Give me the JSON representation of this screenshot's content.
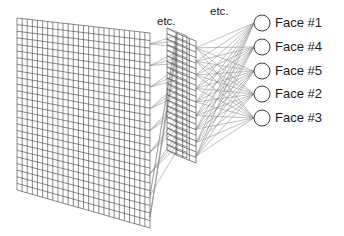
{
  "diagram": {
    "type": "neural-network",
    "background_color": "#ffffff",
    "line_color": "#8c8c8c",
    "grid_color": "#4a4a4a",
    "text_color": "#1a1a1a",
    "annotations": [
      {
        "id": "etc-hidden",
        "text": "etc.",
        "x": 157,
        "y": 22
      },
      {
        "id": "etc-output",
        "text": "etc.",
        "x": 210,
        "y": 12
      }
    ],
    "input_layer": {
      "name": "input-image-grid",
      "cols": 26,
      "rows": 26,
      "top_left": {
        "x": 17,
        "y": 18
      },
      "top_right": {
        "x": 150,
        "y": 33
      },
      "bottom_left": {
        "x": 17,
        "y": 190
      },
      "bottom_right": {
        "x": 150,
        "y": 228
      }
    },
    "hidden_layer": {
      "name": "hidden-layer-slab",
      "cols": 3,
      "rows": 22,
      "depth_cols": 2,
      "top_left": {
        "x": 176,
        "y": 33
      },
      "top_right": {
        "x": 196,
        "y": 41
      },
      "bottom_left": {
        "x": 176,
        "y": 155
      },
      "bottom_right": {
        "x": 196,
        "y": 163
      }
    },
    "output_layer": {
      "name": "output-nodes",
      "circle_radius": 8,
      "circle_x": 262,
      "label_x": 275,
      "nodes": [
        {
          "id": "face-1",
          "label": "Face #1",
          "y": 23
        },
        {
          "id": "face-4",
          "label": "Face #4",
          "y": 47
        },
        {
          "id": "face-5",
          "label": "Face #5",
          "y": 71
        },
        {
          "id": "face-2",
          "label": "Face #2",
          "y": 94
        },
        {
          "id": "face-3",
          "label": "Face #3",
          "y": 118
        }
      ]
    }
  }
}
